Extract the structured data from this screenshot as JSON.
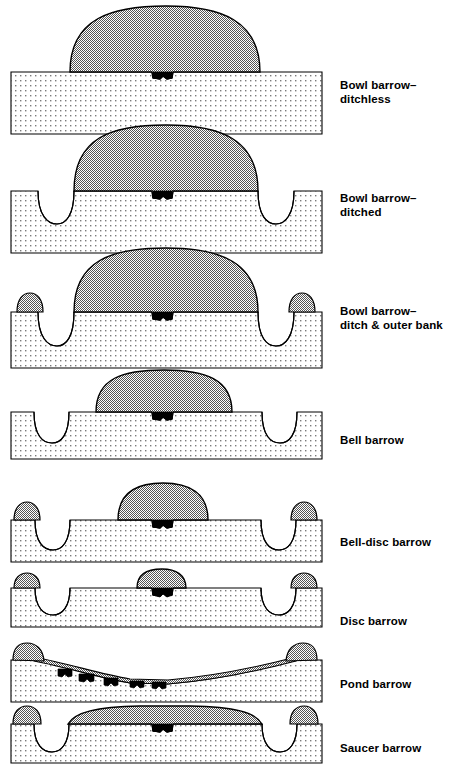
{
  "figure": {
    "colors": {
      "mound_fill": "#b9b9b9",
      "ground_fill": "#ececec",
      "outline": "#000000",
      "burial_fill": "#000000",
      "background": "#ffffff"
    },
    "legend_keys": {
      "mound": "mound",
      "ground": "natural ground / subsoil",
      "ditch": "ditch",
      "outer_bank": "outer bank",
      "berm": "berm",
      "burial": "burial pit"
    }
  },
  "rows": [
    {
      "id": "bowl-barrow-ditchless",
      "label": "Bowl barrow–\nditchless",
      "label_line1": "Bowl barrow–",
      "label_line2": "ditchless",
      "features": [
        "mound",
        "burial"
      ],
      "mound_span": [
        70,
        260
      ],
      "mound_height": 66,
      "ditches": 0,
      "outer_banks": 0,
      "berm": false,
      "burials": 1
    },
    {
      "id": "bowl-barrow-ditched",
      "label": "Bowl barrow–\nditched",
      "label_line1": "Bowl barrow–",
      "label_line2": "ditched",
      "features": [
        "mound",
        "ditch",
        "burial"
      ],
      "mound_span": [
        66,
        264
      ],
      "mound_height": 64,
      "ditches": 2,
      "outer_banks": 0,
      "berm": false,
      "burials": 1
    },
    {
      "id": "bowl-barrow-ditch-outer-bank",
      "label": "Bowl barrow–\nditch & outer bank",
      "label_line1": "Bowl barrow–",
      "label_line2": "ditch & outer bank",
      "features": [
        "mound",
        "ditch",
        "outer_bank",
        "burial"
      ],
      "mound_span": [
        70,
        260
      ],
      "mound_height": 62,
      "ditches": 2,
      "outer_banks": 2,
      "berm": false,
      "burials": 1
    },
    {
      "id": "bell-barrow",
      "label": "Bell barrow",
      "label_line1": "Bell barrow",
      "label_line2": "",
      "features": [
        "mound",
        "berm",
        "ditch",
        "burial"
      ],
      "mound_span": [
        96,
        232
      ],
      "mound_height": 42,
      "ditches": 2,
      "outer_banks": 0,
      "berm": true,
      "burials": 1
    },
    {
      "id": "bell-disc-barrow",
      "label": "Bell-disc barrow",
      "label_line1": "Bell-disc barrow",
      "label_line2": "",
      "features": [
        "mound",
        "berm",
        "ditch",
        "outer_bank",
        "burial"
      ],
      "mound_span": [
        118,
        208
      ],
      "mound_height": 37,
      "ditches": 2,
      "outer_banks": 2,
      "berm": true,
      "burials": 1
    },
    {
      "id": "disc-barrow",
      "label": "Disc barrow",
      "label_line1": "Disc barrow",
      "label_line2": "",
      "features": [
        "mound",
        "berm",
        "ditch",
        "outer_bank",
        "burial"
      ],
      "mound_span": [
        137,
        186
      ],
      "mound_height": 18,
      "ditches": 2,
      "outer_banks": 2,
      "berm": true,
      "burials": 1
    },
    {
      "id": "pond-barrow",
      "label": "Pond barrow",
      "label_line1": "Pond barrow",
      "label_line2": "",
      "features": [
        "hollow",
        "outer_bank",
        "burial"
      ],
      "mound_span": [
        30,
        300
      ],
      "mound_height": 0,
      "ditches": 0,
      "outer_banks": 2,
      "berm": false,
      "burials": 5
    },
    {
      "id": "saucer-barrow",
      "label": "Saucer barrow",
      "label_line1": "Saucer barrow",
      "label_line2": "",
      "features": [
        "mound",
        "ditch",
        "outer_bank",
        "burial"
      ],
      "mound_span": [
        68,
        262
      ],
      "mound_height": 16,
      "ditches": 2,
      "outer_banks": 2,
      "berm": false,
      "burials": 1
    }
  ]
}
